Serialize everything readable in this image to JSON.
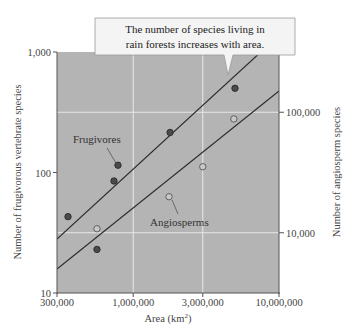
{
  "chart_data": {
    "type": "scatter",
    "title": "",
    "callout": [
      "The number of species living in",
      "rain forests increases with area."
    ],
    "xlabel": "Area (km",
    "xlabel_sup": "2",
    "xlabel_close": ")",
    "ylabel": "Number of frugivorous vertebrate species",
    "y2label": "Number of angiosperm species",
    "xscale": "log",
    "yscale": "log",
    "xlim": [
      300000,
      10000000
    ],
    "ylim": [
      10,
      1000
    ],
    "y2lim": [
      3162,
      316228
    ],
    "x_ticks": [
      {
        "value": 300000,
        "label": "300,000"
      },
      {
        "value": 1000000,
        "label": "1,000,000"
      },
      {
        "value": 3000000,
        "label": "3,000,000"
      },
      {
        "value": 10000000,
        "label": "10,000,000"
      }
    ],
    "y_ticks": [
      {
        "value": 10,
        "label": "10"
      },
      {
        "value": 100,
        "label": "100"
      },
      {
        "value": 1000,
        "label": "1,000"
      }
    ],
    "y2_ticks": [
      {
        "value": 10000,
        "label": "10,000"
      },
      {
        "value": 100000,
        "label": "100,000"
      }
    ],
    "grid": true,
    "series": [
      {
        "name": "Frugivores",
        "axis": "left",
        "marker": "filled-circle",
        "points": [
          {
            "x": 357000,
            "y": 43
          },
          {
            "x": 564000,
            "y": 23
          },
          {
            "x": 738000,
            "y": 85
          },
          {
            "x": 786000,
            "y": 115
          },
          {
            "x": 1790000,
            "y": 215
          },
          {
            "x": 4990000,
            "y": 500
          }
        ],
        "fit_line": {
          "x0": 300000,
          "y0": 28,
          "x1": 7500000,
          "y1": 1000
        }
      },
      {
        "name": "Angiosperms",
        "axis": "right",
        "marker": "open-circle",
        "points": [
          {
            "x": 564000,
            "y": 10800
          },
          {
            "x": 1760000,
            "y": 19900
          },
          {
            "x": 3000000,
            "y": 35300
          },
          {
            "x": 4900000,
            "y": 88000
          }
        ],
        "fit_line": {
          "x0": 300000,
          "y0": 5000,
          "x1": 10000000,
          "y1": 150000
        }
      }
    ],
    "annotations": [
      {
        "text": "Frugivores",
        "series": "Frugivores"
      },
      {
        "text": "Angiosperms",
        "series": "Angiosperms"
      }
    ]
  }
}
